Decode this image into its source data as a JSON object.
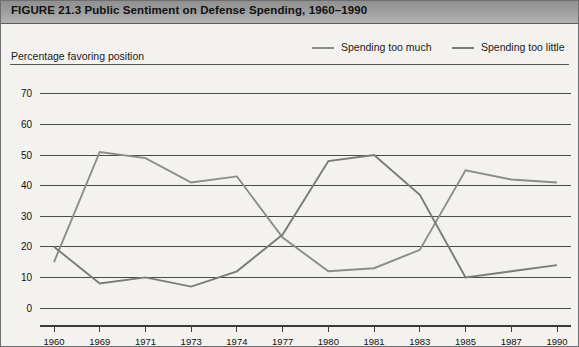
{
  "figure": {
    "title": "FIGURE 21.3  Public Sentiment on Defense Spending, 1960–1990",
    "axis_caption": "Percentage favoring position"
  },
  "legend": {
    "items": [
      {
        "label": "Spending too much",
        "color": "#8c8c8c",
        "icon": "line-swatch"
      },
      {
        "label": "Spending too little",
        "color": "#7a7a7a",
        "icon": "line-swatch"
      }
    ]
  },
  "colors": {
    "title_band_top": "#8f8f8f",
    "title_band_bottom": "#b4b4b4",
    "plot_background": "#f3f2ef",
    "gridline": "#4a4a4a",
    "series_too_much": "#8c8c8c",
    "series_too_little": "#7a7a7a"
  },
  "chart_data": {
    "type": "line",
    "title": "Public Sentiment on Defense Spending, 1960–1990",
    "xlabel": "",
    "ylabel": "Percentage favoring position",
    "ylim": [
      0,
      75
    ],
    "yticks": [
      0,
      10,
      20,
      30,
      40,
      50,
      60,
      70
    ],
    "grid": true,
    "legend_position": "top-right",
    "categories": [
      "1960",
      "1969",
      "1971",
      "1973",
      "1974",
      "1977",
      "1980",
      "1981",
      "1983",
      "1985",
      "1987",
      "1990"
    ],
    "series": [
      {
        "name": "Spending too much",
        "color": "#8c8c8c",
        "values": [
          15,
          51,
          49,
          41,
          43,
          23,
          12,
          13,
          19,
          45,
          42,
          41
        ]
      },
      {
        "name": "Spending too little",
        "color": "#7a7a7a",
        "values": [
          20,
          8,
          10,
          7,
          12,
          24,
          48,
          50,
          37,
          10,
          12,
          14
        ]
      }
    ]
  }
}
